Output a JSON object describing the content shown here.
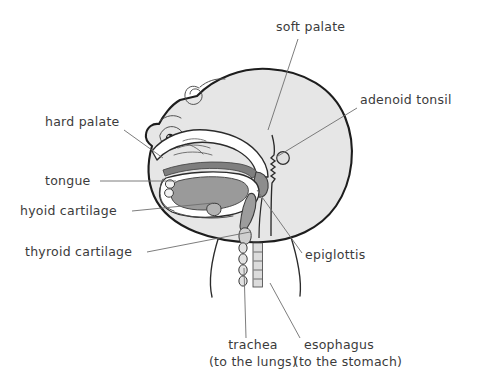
{
  "diagram": {
    "background_color": "#ffffff",
    "ink_color": "#1d1d1d",
    "label_color": "#3b3b3b",
    "leader_color": "#6e6e6e",
    "head_fill": "#e6e6e6",
    "cavity_fill": "#ffffff",
    "tongue_fill": "#9a9a9a",
    "soft_tissue_fill": "#8d8d8d",
    "palate_fill": "#7e7e7e"
  },
  "labels": [
    {
      "id": "soft-palate",
      "text": "soft palate",
      "text_x": 276,
      "text_y": 31,
      "anchor": "start",
      "leader": "M 298 39 L 268 130"
    },
    {
      "id": "adenoid-tonsil",
      "text": "adenoid tonsil",
      "text_x": 360,
      "text_y": 104,
      "anchor": "start",
      "leader": "M 357 108 L 278 156"
    },
    {
      "id": "hard-palate",
      "text": "hard palate",
      "text_x": 45,
      "text_y": 126,
      "anchor": "start",
      "leader": "M 124 130 L 163 158"
    },
    {
      "id": "tongue",
      "text": "tongue",
      "text_x": 45,
      "text_y": 185,
      "anchor": "start",
      "leader": "M 100 181 L 176 181"
    },
    {
      "id": "hyoid-cartilage",
      "text": "hyoid cartilage",
      "text_x": 20,
      "text_y": 215,
      "anchor": "start",
      "leader": "M 132 211 L 213 203"
    },
    {
      "id": "thyroid-cartilage",
      "text": "thyroid cartilage",
      "text_x": 25,
      "text_y": 256,
      "anchor": "start",
      "leader": "M 147 252 L 250 232"
    },
    {
      "id": "epiglottis",
      "text": "epiglottis",
      "text_x": 305,
      "text_y": 259,
      "anchor": "start",
      "leader": "M 302 253 L 257 190"
    },
    {
      "id": "trachea",
      "text": "trachea",
      "text_x": 253,
      "text_y": 349,
      "anchor": "middle",
      "leader": "M 246 338 L 244 268"
    },
    {
      "id": "trachea-sub",
      "text": "(to the lungs)",
      "text_x": 253,
      "text_y": 366,
      "anchor": "middle",
      "leader": ""
    },
    {
      "id": "esophagus",
      "text": "esophagus",
      "text_x": 339,
      "text_y": 349,
      "anchor": "middle",
      "leader": "M 300 338 L 270 283"
    },
    {
      "id": "esophagus-sub",
      "text": "(to the stomach)",
      "text_x": 348,
      "text_y": 366,
      "anchor": "middle",
      "leader": ""
    }
  ]
}
